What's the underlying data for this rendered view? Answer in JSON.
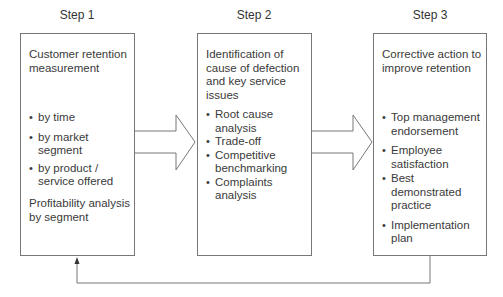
{
  "steps": [
    {
      "title": "Step 1",
      "heading": "Customer retention measurement",
      "bullets": [
        "by time",
        "by market segment",
        "by product / service offered"
      ],
      "footer": "Profitability analysis by segment"
    },
    {
      "title": "Step 2",
      "heading": "Identification of cause of defection and key service issues",
      "bullets": [
        "Root cause analysis",
        "Trade-off",
        "Competitive benchmarking",
        "Complaints analysis"
      ]
    },
    {
      "title": "Step 3",
      "heading": "Corrective action to improve retention",
      "bullets": [
        "Top management endorsement",
        "Employee satisfaction",
        "Best demonstrated practice",
        "Implementation plan"
      ]
    }
  ],
  "connectors": {
    "arrow_1": "block-arrow step1 to step2",
    "arrow_2": "block-arrow step2 to step3",
    "feedback": "feedback loop step3 to step1"
  },
  "colors": {
    "line": "#777777",
    "text": "#3a3a3a",
    "background": "#ffffff"
  }
}
